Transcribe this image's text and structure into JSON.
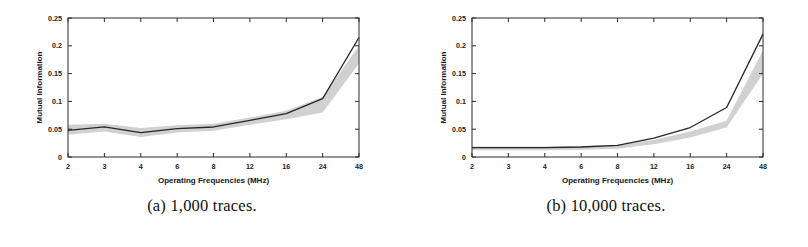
{
  "figure": {
    "background": "#ffffff",
    "panel_count": 2
  },
  "panels": [
    {
      "id": "panel-a",
      "caption": "(a) 1,000 traces.",
      "chart_data": {
        "type": "line",
        "title": "",
        "xlabel": "Operating Frequencies (MHz)",
        "ylabel": "Mutual Information",
        "categories": [
          "2",
          "3",
          "4",
          "6",
          "8",
          "12",
          "16",
          "24",
          "48"
        ],
        "x_tick_labels": [
          "2",
          "3",
          "4",
          "6",
          "8",
          "12",
          "16",
          "24",
          "48"
        ],
        "y_tick_labels": [
          "0",
          "0.05",
          "0.1",
          "0.15",
          "0.2",
          "0.25"
        ],
        "y_tick_values": [
          0,
          0.05,
          0.1,
          0.15,
          0.2,
          0.25
        ],
        "ylim": [
          0,
          0.25
        ],
        "grid": false,
        "legend": "none",
        "series": [
          {
            "name": "mean mutual information",
            "style": "solid-dark-line",
            "color": "#262626",
            "values": [
              0.048,
              0.054,
              0.044,
              0.051,
              0.054,
              0.066,
              0.078,
              0.105,
              0.215
            ]
          },
          {
            "name": "spread band upper",
            "style": "light-gray-band",
            "color": "#c9c9c9",
            "values": [
              0.058,
              0.06,
              0.052,
              0.057,
              0.06,
              0.071,
              0.083,
              0.108,
              0.2
            ]
          },
          {
            "name": "spread band lower",
            "style": "light-gray-band",
            "color": "#c9c9c9",
            "values": [
              0.04,
              0.046,
              0.036,
              0.044,
              0.047,
              0.058,
              0.068,
              0.08,
              0.168
            ]
          }
        ]
      }
    },
    {
      "id": "panel-b",
      "caption": "(b) 10,000 traces.",
      "chart_data": {
        "type": "line",
        "title": "",
        "xlabel": "Operating Frequencies (MHz)",
        "ylabel": "Mutual Information",
        "categories": [
          "2",
          "3",
          "4",
          "6",
          "8",
          "12",
          "16",
          "24",
          "48"
        ],
        "x_tick_labels": [
          "2",
          "3",
          "4",
          "6",
          "8",
          "12",
          "16",
          "24",
          "48"
        ],
        "y_tick_labels": [
          "0",
          "0.05",
          "0.1",
          "0.15",
          "0.2",
          "0.25"
        ],
        "y_tick_values": [
          0,
          0.05,
          0.1,
          0.15,
          0.2,
          0.25
        ],
        "ylim": [
          0,
          0.25
        ],
        "grid": false,
        "legend": "none",
        "series": [
          {
            "name": "mean mutual information",
            "style": "solid-dark-line",
            "color": "#262626",
            "values": [
              0.017,
              0.017,
              0.017,
              0.018,
              0.021,
              0.034,
              0.053,
              0.089,
              0.221
            ]
          },
          {
            "name": "spread band upper",
            "style": "light-gray-band",
            "color": "#c9c9c9",
            "values": [
              0.019,
              0.019,
              0.019,
              0.02,
              0.022,
              0.031,
              0.046,
              0.065,
              0.192
            ]
          },
          {
            "name": "spread band lower",
            "style": "light-gray-band",
            "color": "#c9c9c9",
            "values": [
              0.012,
              0.012,
              0.012,
              0.013,
              0.015,
              0.023,
              0.035,
              0.053,
              0.15
            ]
          }
        ]
      }
    }
  ]
}
